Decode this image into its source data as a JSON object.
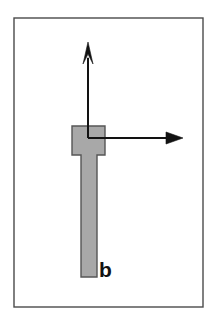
{
  "figure": {
    "canvas": {
      "width": 213,
      "height": 320,
      "background_color": "#ffffff"
    },
    "frame": {
      "name": "figure-border",
      "x": 14,
      "y": 18,
      "width": 189,
      "height": 289,
      "stroke_color": "#4a4a4a",
      "stroke_width": 1.4,
      "fill": "none"
    },
    "body": {
      "name": "t-shaped-body",
      "fill_color": "#a8a8a8",
      "stroke_color": "#555555",
      "stroke_width": 1.4,
      "head": {
        "x": 72,
        "y": 126,
        "width": 33,
        "height": 29
      },
      "stem": {
        "x": 81,
        "y": 155,
        "width": 16,
        "height": 122
      },
      "outline_points": "72,126 105,126 105,155 97,155 97,277 81,277 81,155 72,155"
    },
    "origin": {
      "name": "axes-origin",
      "x": 88,
      "y": 138
    },
    "axes": [
      {
        "name": "vertical-axis-arrow",
        "direction": "up",
        "from_x": 88,
        "from_y": 138,
        "to_x": 88,
        "to_y": 42,
        "stroke_color": "#121212",
        "stroke_width": 2.0,
        "arrowhead": {
          "style": "narrow-elongated",
          "length": 22,
          "half_width": 5,
          "fill_color": "#121212"
        }
      },
      {
        "name": "horizontal-axis-arrow",
        "direction": "right",
        "from_x": 88,
        "from_y": 138,
        "to_x": 183,
        "to_y": 138,
        "stroke_color": "#121212",
        "stroke_width": 2.0,
        "arrowhead": {
          "style": "solid-triangle",
          "length": 17,
          "half_width": 6,
          "fill_color": "#121212"
        }
      }
    ],
    "labels": [
      {
        "name": "label-b",
        "text": "b",
        "x": 99,
        "y": 277,
        "font_size": 21,
        "font_weight": "bold",
        "color": "#121212"
      }
    ]
  }
}
